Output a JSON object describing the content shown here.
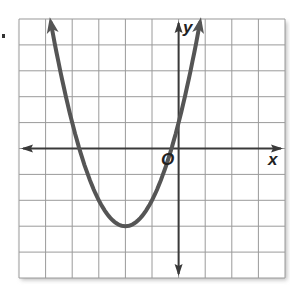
{
  "chart_data": {
    "type": "line",
    "title": "",
    "function": "y = (x + 2)^2 - 3",
    "xlabel": "x",
    "ylabel": "y",
    "origin_label": "O",
    "xlim": [
      -6,
      4
    ],
    "ylim": [
      -5,
      5
    ],
    "grid": true,
    "grid_step": 1,
    "vertex": {
      "x": -2,
      "y": -3
    },
    "y_intercept": 1,
    "x_intercepts": [
      -3.73,
      -0.27
    ],
    "series": [
      {
        "name": "parabola",
        "x": [
          -4.8,
          -4.5,
          -4,
          -3.5,
          -3,
          -2.5,
          -2,
          -1.5,
          -1,
          -0.5,
          0,
          0.5,
          0.8
        ],
        "values": [
          4.84,
          3.25,
          1,
          -0.75,
          -2,
          -2.75,
          -3,
          -2.75,
          -2,
          -0.75,
          1,
          3.25,
          4.84
        ]
      }
    ],
    "legend": null
  },
  "colors": {
    "curve": "#555555",
    "axis": "#3a3a3a",
    "grid": "#9a9a9a",
    "shadow": "#bdbdbd"
  },
  "labels": {
    "x_axis": "x",
    "y_axis": "y",
    "origin": "O"
  }
}
